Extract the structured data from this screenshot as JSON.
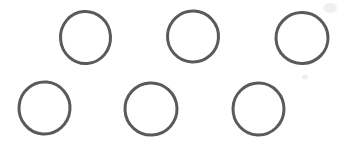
{
  "figure": {
    "title": "Six Circles",
    "background_color": "#ffffff",
    "stroke_color": "#5a5a5a",
    "stroke_width": 3,
    "canvas": {
      "width": 344,
      "height": 145
    },
    "shape_kind": "circle-outline",
    "shape_count": 6,
    "rows": 2,
    "columns": 3,
    "shapes": [
      {
        "id": "circle-top-left",
        "row": 1,
        "column": 1,
        "label": "Circle 1",
        "cx": 85.5,
        "cy": 37.5,
        "rx": 25.0,
        "ry": 26.0,
        "rotation": -4
      },
      {
        "id": "circle-top-center",
        "row": 1,
        "column": 2,
        "label": "Circle 2",
        "cx": 193.0,
        "cy": 36.5,
        "rx": 25.5,
        "ry": 25.5,
        "rotation": 3
      },
      {
        "id": "circle-top-right",
        "row": 1,
        "column": 3,
        "label": "Circle 3",
        "cx": 302.0,
        "cy": 38.0,
        "rx": 26.0,
        "ry": 25.5,
        "rotation": -2
      },
      {
        "id": "circle-bottom-left",
        "row": 2,
        "column": 1,
        "label": "Circle 4",
        "cx": 44.5,
        "cy": 108.0,
        "rx": 25.5,
        "ry": 26.0,
        "rotation": 5
      },
      {
        "id": "circle-bottom-center",
        "row": 2,
        "column": 2,
        "label": "Circle 5",
        "cx": 151.0,
        "cy": 109.0,
        "rx": 26.0,
        "ry": 26.0,
        "rotation": -3
      },
      {
        "id": "circle-bottom-right",
        "row": 2,
        "column": 3,
        "label": "Circle 6",
        "cx": 258.5,
        "cy": 109.0,
        "rx": 25.5,
        "ry": 26.0,
        "rotation": 2
      }
    ],
    "artifacts": [
      {
        "id": "scan-speck-top-right",
        "label": "Faint scan speck",
        "cx": 330.0,
        "cy": 8.0,
        "rx": 7.0,
        "ry": 5.0,
        "color": "#f0f0f0"
      },
      {
        "id": "scan-speck-mid-right",
        "label": "Faint scan speck",
        "cx": 305.0,
        "cy": 77.0,
        "rx": 3.0,
        "ry": 2.5,
        "color": "#f0f0f0"
      }
    ]
  }
}
